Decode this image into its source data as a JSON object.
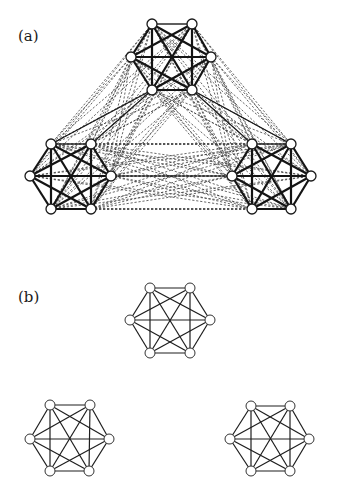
{
  "panels": [
    {
      "id": "a",
      "label": "(a)",
      "label_pos": [
        18,
        41
      ],
      "description": "Three complete K6 clusters with heavy intra-cluster edges, dashed inter-cluster edges, and a few solid bridge edges",
      "node_radius": 5,
      "clusters": [
        {
          "name": "top",
          "nodes": [
            [
              152,
              24
            ],
            [
              192,
              24
            ],
            [
              211,
              57
            ],
            [
              192,
              90
            ],
            [
              152,
              90
            ],
            [
              131,
              57
            ]
          ]
        },
        {
          "name": "bottom-left",
          "nodes": [
            [
              51,
              144
            ],
            [
              91,
              144
            ],
            [
              111,
              176
            ],
            [
              91,
              209
            ],
            [
              51,
              209
            ],
            [
              30,
              176
            ]
          ]
        },
        {
          "name": "bottom-right",
          "nodes": [
            [
              252,
              144
            ],
            [
              291,
              144
            ],
            [
              311,
              176
            ],
            [
              291,
              209
            ],
            [
              252,
              209
            ],
            [
              232,
              176
            ]
          ]
        }
      ],
      "bridges": [
        [
          [
            152,
            90
          ],
          [
            51,
            144
          ]
        ],
        [
          [
            152,
            90
          ],
          [
            91,
            144
          ]
        ],
        [
          [
            192,
            90
          ],
          [
            252,
            144
          ]
        ],
        [
          [
            192,
            90
          ],
          [
            291,
            144
          ]
        ],
        [
          [
            111,
            176
          ],
          [
            232,
            176
          ]
        ]
      ]
    },
    {
      "id": "b",
      "label": "(b)",
      "label_pos": [
        18,
        302
      ],
      "description": "Three disconnected complete K6 clusters",
      "node_radius": 5,
      "clusters": [
        {
          "name": "top",
          "nodes": [
            [
              150,
              288
            ],
            [
              190,
              288
            ],
            [
              210,
              320
            ],
            [
              190,
              353
            ],
            [
              150,
              353
            ],
            [
              130,
              320
            ]
          ]
        },
        {
          "name": "bottom-left",
          "nodes": [
            [
              50,
              405
            ],
            [
              90,
              405
            ],
            [
              109,
              439
            ],
            [
              89,
              471
            ],
            [
              50,
              471
            ],
            [
              30,
              439
            ]
          ]
        },
        {
          "name": "bottom-right",
          "nodes": [
            [
              251,
              406
            ],
            [
              290,
              406
            ],
            [
              309,
              439
            ],
            [
              290,
              471
            ],
            [
              251,
              471
            ],
            [
              230,
              439
            ]
          ]
        }
      ]
    }
  ],
  "colors": {
    "background": "#ffffff",
    "ink": "#1a1a1a",
    "node_fill": "#ffffff"
  }
}
